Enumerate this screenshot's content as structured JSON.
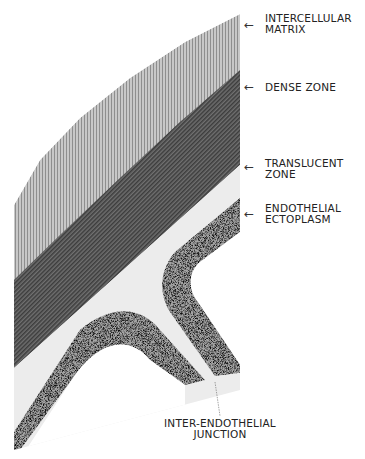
{
  "figure": {
    "type": "schematic cross-section of capillary wall / endothelial junction",
    "colors": {
      "background": "#ffffff",
      "intercellular_matrix": "#b4b4b4",
      "dense_zone": "#5e5e5e",
      "translucent_zone": "#ececec",
      "endothelial_ectoplasm": "#9a9a9a",
      "lumen": "#ffffff"
    }
  },
  "labels": {
    "intercellular_matrix": {
      "line1": "INTERCELLULAR",
      "line2": "MATRIX"
    },
    "dense_zone": {
      "line1": "DENSE ZONE"
    },
    "translucent_zone": {
      "line1": "TRANSLUCENT",
      "line2": "ZONE"
    },
    "endothelial_ectoplasm": {
      "line1": "ENDOTHELIAL",
      "line2": "ECTOPLASM"
    },
    "inter_endothelial_junction": {
      "line1": "INTER-ENDOTHELIAL",
      "line2": "JUNCTION"
    }
  },
  "arrow_glyph": "←"
}
